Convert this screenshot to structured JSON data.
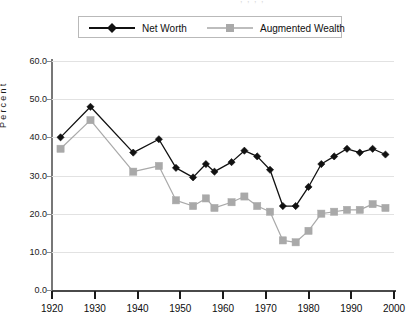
{
  "title_remnant": ", ,   , ,",
  "legend": {
    "position": "top-center",
    "entries": [
      {
        "label": "Net Worth",
        "color": "#111111",
        "marker": "diamond-marker"
      },
      {
        "label": "Augmented Wealth",
        "color": "#a9a9a9",
        "marker": "square-marker"
      }
    ]
  },
  "axes": {
    "ylabel": "Percent",
    "xlabel": "",
    "ytick_labels": [
      "0.0",
      "10.0",
      "20.0",
      "30.0",
      "40.0",
      "50.0",
      "60.0"
    ],
    "xtick_labels": [
      "1920",
      "1930",
      "1940",
      "1950",
      "1960",
      "1970",
      "1980",
      "1990",
      "2000"
    ]
  },
  "chart_data": {
    "type": "line",
    "title": "",
    "subtitle": "",
    "xlabel": "",
    "ylabel": "Percent",
    "xlim": [
      1920,
      2000
    ],
    "ylim": [
      0,
      60
    ],
    "ytick_values": [
      0,
      10,
      20,
      30,
      40,
      50,
      60
    ],
    "xtick_values": [
      1920,
      1930,
      1940,
      1950,
      1960,
      1970,
      1980,
      1990,
      2000
    ],
    "grid": "horizontal",
    "legend_position": "top-center",
    "x": [
      1922,
      1929,
      1939,
      1945,
      1949,
      1953,
      1956,
      1958,
      1962,
      1965,
      1968,
      1971,
      1974,
      1977,
      1980,
      1983,
      1986,
      1989,
      1992,
      1995,
      1998
    ],
    "series": [
      {
        "name": "Net Worth",
        "color": "#111111",
        "marker": "diamond",
        "values": [
          40.0,
          48.0,
          36.0,
          39.5,
          32.0,
          29.5,
          33.0,
          31.0,
          33.5,
          36.5,
          35.0,
          31.5,
          22.0,
          22.0,
          27.0,
          33.0,
          35.0,
          37.0,
          36.0,
          37.0,
          35.5
        ]
      },
      {
        "name": "Augmented Wealth",
        "color": "#a9a9a9",
        "marker": "square",
        "values": [
          37.0,
          44.5,
          31.0,
          32.5,
          23.5,
          22.0,
          24.0,
          21.5,
          23.0,
          24.5,
          22.0,
          20.5,
          13.0,
          12.5,
          15.5,
          20.0,
          20.5,
          21.0,
          21.0,
          22.5,
          21.5
        ]
      }
    ]
  },
  "colors": {
    "net_worth": "#111111",
    "augmented_wealth": "#a9a9a9",
    "gridline": "#e2e2e2",
    "axis": "#4a4a4a",
    "background": "#ffffff"
  }
}
